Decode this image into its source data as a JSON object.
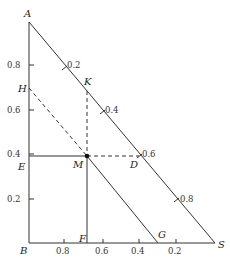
{
  "diagram": {
    "type": "ternary-triangle-construction",
    "points": {
      "A": {
        "label": "A",
        "x": 29,
        "y": 22
      },
      "B": {
        "label": "B",
        "x": 29,
        "y": 243
      },
      "S": {
        "label": "S",
        "x": 215,
        "y": 243
      },
      "H": {
        "label": "H",
        "x": 29,
        "y": 88
      },
      "K": {
        "label": "K",
        "x": 87,
        "y": 83
      },
      "M": {
        "label": "M",
        "x": 87,
        "y": 156
      },
      "D": {
        "label": "D",
        "x": 141,
        "y": 156
      },
      "E": {
        "label": "E",
        "x": 29,
        "y": 156
      },
      "F": {
        "label": "F",
        "x": 87,
        "y": 243
      },
      "G": {
        "label": "G",
        "x": 158,
        "y": 243
      }
    },
    "left_axis_ticks": [
      {
        "label": "0.8",
        "y": 65
      },
      {
        "label": "0.6",
        "y": 110
      },
      {
        "label": "0.4",
        "y": 154
      },
      {
        "label": "0.2",
        "y": 199
      }
    ],
    "bottom_axis_ticks": [
      {
        "label": "0.8",
        "x": 64
      },
      {
        "label": "0.6",
        "x": 103
      },
      {
        "label": "0.4",
        "x": 139
      },
      {
        "label": "0.2",
        "x": 176
      }
    ],
    "hypotenuse_ticks": [
      {
        "label": "0.2",
        "x": 65,
        "y": 67
      },
      {
        "label": "0.4",
        "x": 103,
        "y": 110
      },
      {
        "label": "0.6",
        "x": 141,
        "y": 154
      },
      {
        "label": "0.8",
        "x": 178,
        "y": 199
      }
    ]
  }
}
